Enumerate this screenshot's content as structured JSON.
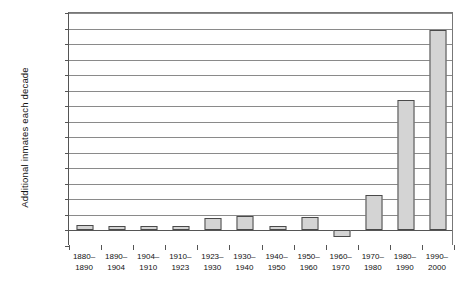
{
  "chart_data": {
    "type": "bar",
    "title": "",
    "xlabel": "",
    "ylabel": "Additional inmates each decade",
    "ylim": [
      -50000,
      700000
    ],
    "ytick_step": 50000,
    "grid": true,
    "legend": "none",
    "categories": [
      "1880–\n1890",
      "1890–\n1904",
      "1904–\n1910",
      "1910–\n1923",
      "1923–\n1930",
      "1930–\n1940",
      "1940–\n1950",
      "1950–\n1960",
      "1960–\n1970",
      "1970–\n1980",
      "1980–\n1990",
      "1990–\n2000"
    ],
    "category_lines": [
      [
        "1880–",
        "1890"
      ],
      [
        "1890–",
        "1904"
      ],
      [
        "1904–",
        "1910"
      ],
      [
        "1910–",
        "1923"
      ],
      [
        "1923–",
        "1930"
      ],
      [
        "1930–",
        "1940"
      ],
      [
        "1940–",
        "1950"
      ],
      [
        "1950–",
        "1960"
      ],
      [
        "1960–",
        "1970"
      ],
      [
        "1970–",
        "1980"
      ],
      [
        "1980–",
        "1990"
      ],
      [
        "1990–",
        "2000"
      ]
    ],
    "values": [
      18000,
      15000,
      15000,
      15000,
      40000,
      45000,
      15000,
      42000,
      -20000,
      115000,
      420000,
      645000
    ],
    "ytick_labels": [
      "700,000",
      "650,000",
      "600,000",
      "550,000",
      "500,000",
      "450,000",
      "400,000",
      "350,000",
      "300,000",
      "250,000",
      "200,000",
      "150,000",
      "100,000",
      "50,000",
      "0",
      "-50,000"
    ],
    "ytick_values": [
      700000,
      650000,
      600000,
      550000,
      500000,
      450000,
      400000,
      350000,
      300000,
      250000,
      200000,
      150000,
      100000,
      50000,
      0,
      -50000
    ],
    "bar_color": "#d4d4d4",
    "bar_border_color": "#4a4a4a",
    "grid_color": "#8a8a8a",
    "axis_color": "#555555"
  }
}
